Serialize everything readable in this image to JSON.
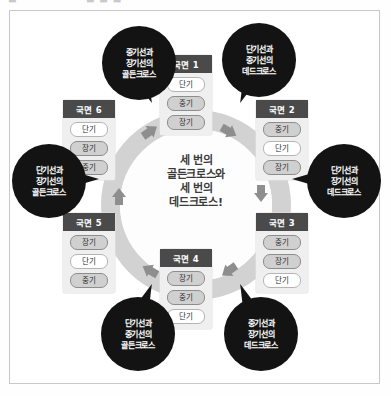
{
  "top_strip": {
    "fragment_a": "▬",
    "fragment_b": "▬ ▬ ▬"
  },
  "center": {
    "text": "세 번의\n골든크로스와\n세 번의\n데드크로스!"
  },
  "pill_labels": {
    "short": "단기",
    "mid": "중기",
    "long": "장기"
  },
  "phases": [
    {
      "id": "phase-1",
      "title": "국면 1",
      "rows": [
        {
          "label": "단기",
          "fill": "white"
        },
        {
          "label": "중기",
          "fill": "gray"
        },
        {
          "label": "장기",
          "fill": "gray"
        }
      ]
    },
    {
      "id": "phase-2",
      "title": "국면 2",
      "rows": [
        {
          "label": "중기",
          "fill": "gray"
        },
        {
          "label": "단기",
          "fill": "white"
        },
        {
          "label": "장기",
          "fill": "gray"
        }
      ]
    },
    {
      "id": "phase-3",
      "title": "국면 3",
      "rows": [
        {
          "label": "중기",
          "fill": "gray"
        },
        {
          "label": "장기",
          "fill": "gray"
        },
        {
          "label": "단기",
          "fill": "white"
        }
      ]
    },
    {
      "id": "phase-4",
      "title": "국면 4",
      "rows": [
        {
          "label": "장기",
          "fill": "gray"
        },
        {
          "label": "중기",
          "fill": "gray"
        },
        {
          "label": "단기",
          "fill": "white"
        }
      ]
    },
    {
      "id": "phase-5",
      "title": "국면 5",
      "rows": [
        {
          "label": "장기",
          "fill": "gray"
        },
        {
          "label": "단기",
          "fill": "white"
        },
        {
          "label": "중기",
          "fill": "gray"
        }
      ]
    },
    {
      "id": "phase-6",
      "title": "국면 6",
      "rows": [
        {
          "label": "단기",
          "fill": "white"
        },
        {
          "label": "장기",
          "fill": "gray"
        },
        {
          "label": "중기",
          "fill": "gray"
        }
      ]
    }
  ],
  "callouts": [
    {
      "id": "callout-top-left",
      "text": "중기선과\n장기선의\n골든크로스",
      "cross_type": "golden"
    },
    {
      "id": "callout-top-right",
      "text": "단기선과\n중기선의\n데드크로스",
      "cross_type": "dead"
    },
    {
      "id": "callout-right",
      "text": "단기선과\n장기선의\n데드크로스",
      "cross_type": "dead"
    },
    {
      "id": "callout-bottom-right",
      "text": "중기선과\n장기선의\n데드크로스",
      "cross_type": "dead"
    },
    {
      "id": "callout-bottom-left",
      "text": "단기선과\n중기선의\n골든크로스",
      "cross_type": "golden"
    },
    {
      "id": "callout-left",
      "text": "단기선과\n장기선의\n골든크로스",
      "cross_type": "golden"
    }
  ],
  "colors": {
    "bubble_background": "#131313",
    "bubble_text": "#ffffff",
    "phase_header_background": "#4a4a4a",
    "phase_box_background": "#efefef",
    "pill_gray": "#d0d0d0",
    "pill_white": "#ffffff",
    "ring": "#d2d2d2",
    "arrow": "#8e8e8e",
    "frame_border": "#c8c8c8"
  }
}
